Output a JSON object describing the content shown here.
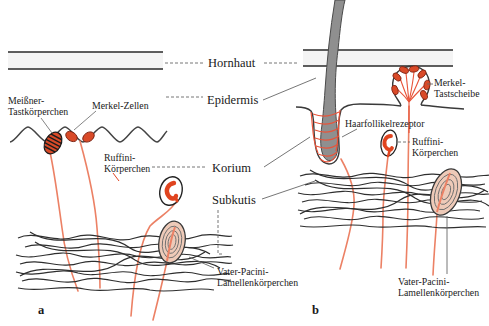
{
  "figure": {
    "title_implicit": "Hautrezeptoren Schema",
    "panels": {
      "a": "a",
      "b": "b"
    },
    "layers": {
      "hornhaut": "Hornhaut",
      "epidermis": "Epidermis",
      "korium": "Korium",
      "subkutis": "Subkutis"
    },
    "receptors": {
      "meissner_line1": "Meißner-",
      "meissner_line2": "Tastkörperchen",
      "merkel_zellen": "Merkel-Zellen",
      "ruffini_a_line1": "Ruffini-",
      "ruffini_a_line2": "Körperchen",
      "vater_pacini_a_line1": "Vater-Pacini-",
      "vater_pacini_a_line2": "Lamellenkörperchen",
      "haarfollikelrezeptor": "Haarfollikelrezeptor",
      "merkel_tastscheibe_line1": "Merkel-",
      "merkel_tastscheibe_line2": "Tastscheibe",
      "ruffini_b_line1": "Ruffini-",
      "ruffini_b_line2": "Körperchen",
      "vater_pacini_b_line1": "Vater-Pacini-",
      "vater_pacini_b_line2": "Lamellenkörperchen"
    },
    "colors": {
      "nerve_fiber": "#ec8165",
      "receptor_red": "#d94a28",
      "receptor_outline": "#7a2010",
      "hair_gray": "#8f8f8f",
      "line_dark": "#2e2e2e",
      "pacini_fill": "#eecab8",
      "band_fill": "#f4f4f4",
      "leader_gray": "#666666"
    }
  }
}
